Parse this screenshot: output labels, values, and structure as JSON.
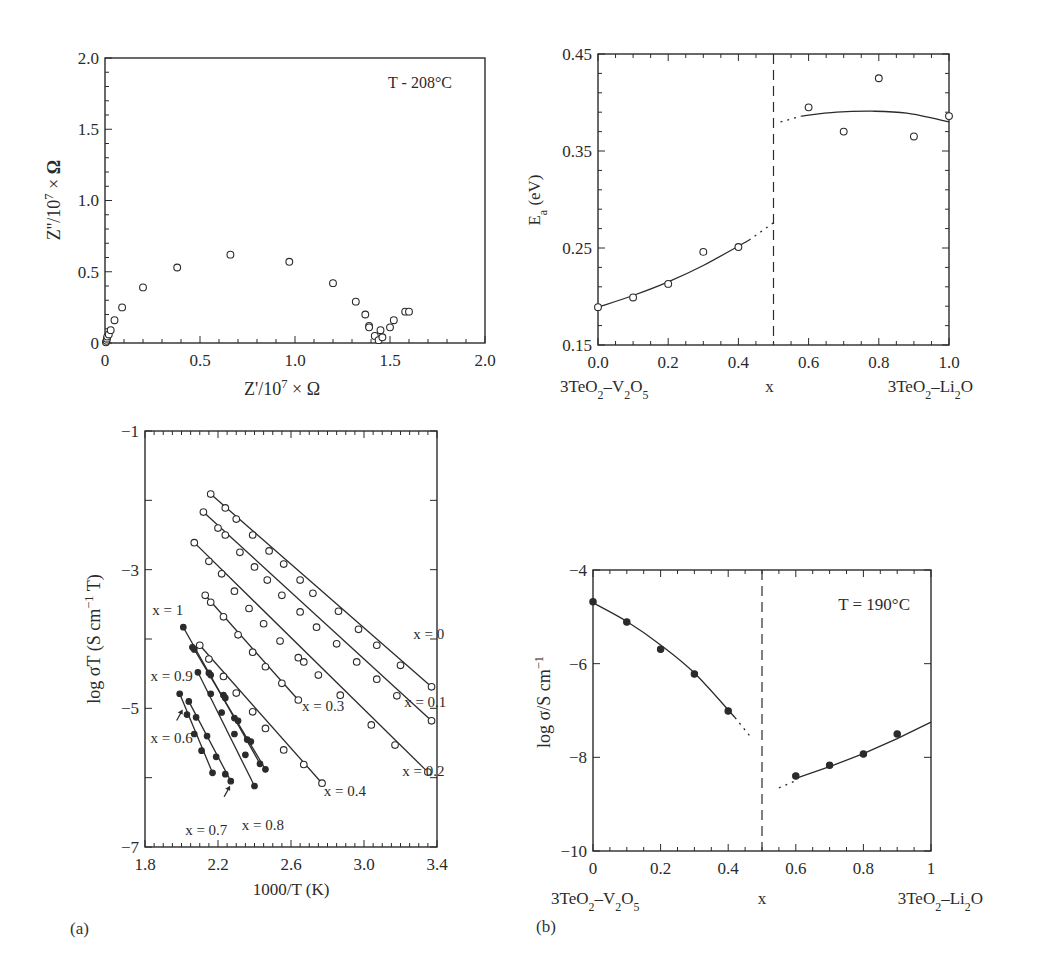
{
  "panel_labels": {
    "a": "(a)",
    "b": "(b)"
  },
  "chart_data": [
    {
      "id": "nyquist",
      "type": "scatter",
      "title": "",
      "annotation": "T - 208°C",
      "xlabel": "Z'/10^7 × Ω",
      "ylabel": "Z''/10^7 × Ω",
      "xlim": [
        0,
        2.0
      ],
      "ylim": [
        0,
        2.0
      ],
      "xticks": [
        "0",
        "0.5",
        "1.0",
        "1.5",
        "2.0"
      ],
      "yticks": [
        "0",
        "0.5",
        "1.0",
        "1.5",
        "2.0"
      ],
      "grid": false,
      "marker": "open-circle",
      "points": [
        [
          0.005,
          0.005
        ],
        [
          0.008,
          0.015
        ],
        [
          0.01,
          0.03
        ],
        [
          0.012,
          0.045
        ],
        [
          0.02,
          0.06
        ],
        [
          0.03,
          0.09
        ],
        [
          0.05,
          0.16
        ],
        [
          0.09,
          0.25
        ],
        [
          0.2,
          0.39
        ],
        [
          0.38,
          0.53
        ],
        [
          0.66,
          0.62
        ],
        [
          0.97,
          0.57
        ],
        [
          1.2,
          0.42
        ],
        [
          1.32,
          0.29
        ],
        [
          1.37,
          0.2
        ],
        [
          1.39,
          0.12
        ],
        [
          1.39,
          0.11
        ],
        [
          1.42,
          0.05
        ],
        [
          1.44,
          0.02
        ],
        [
          1.45,
          0.09
        ],
        [
          1.46,
          0.04
        ],
        [
          1.5,
          0.11
        ],
        [
          1.52,
          0.16
        ],
        [
          1.58,
          0.22
        ],
        [
          1.6,
          0.22
        ]
      ]
    },
    {
      "id": "activation-energy",
      "type": "scatter",
      "title": "",
      "xlabel": "x",
      "ylabel": "Ea (eV)",
      "x_end_labels": {
        "left": "3TeO2–V2O5",
        "right": "3TeO2–Li2O"
      },
      "xlim": [
        0.0,
        1.0
      ],
      "ylim": [
        0.15,
        0.45
      ],
      "xticks": [
        "0.0",
        "0.2",
        "0.4",
        "0.6",
        "0.8",
        "1.0"
      ],
      "yticks": [
        "0.15",
        "0.25",
        "0.35",
        "0.45"
      ],
      "divider_x": 0.5,
      "grid": false,
      "marker": "open-circle",
      "x": [
        0.0,
        0.1,
        0.2,
        0.3,
        0.4,
        0.6,
        0.7,
        0.8,
        0.9,
        1.0
      ],
      "values": [
        0.189,
        0.199,
        0.213,
        0.246,
        0.251,
        0.395,
        0.37,
        0.425,
        0.365,
        0.386
      ],
      "fit_left": [
        [
          0.0,
          0.189
        ],
        [
          0.1,
          0.201
        ],
        [
          0.2,
          0.215
        ],
        [
          0.3,
          0.232
        ],
        [
          0.43,
          0.258
        ]
      ],
      "fit_left_dotted": [
        [
          0.43,
          0.258
        ],
        [
          0.5,
          0.276
        ]
      ],
      "fit_right_dotted": [
        [
          0.52,
          0.38
        ],
        [
          0.58,
          0.386
        ]
      ],
      "fit_right": [
        [
          0.58,
          0.386
        ],
        [
          0.68,
          0.39
        ],
        [
          0.78,
          0.391
        ],
        [
          0.88,
          0.389
        ],
        [
          1.0,
          0.38
        ]
      ]
    },
    {
      "id": "arrhenius",
      "type": "line",
      "title": "",
      "xlabel": "1000/T (K)",
      "ylabel": "log σT (S cm⁻¹ T)",
      "xlim": [
        1.8,
        3.4
      ],
      "ylim": [
        -7,
        -1
      ],
      "xticks": [
        "1.8",
        "2.2",
        "2.6",
        "3.0",
        "3.4"
      ],
      "yticks": [
        "-7",
        "-5",
        "-3",
        "-1"
      ],
      "grid": false,
      "series": [
        {
          "name": "x = 0",
          "marker": "open",
          "label_pos": [
            3.27,
            -4.0
          ],
          "points": [
            [
              2.16,
              -1.91
            ],
            [
              2.24,
              -2.11
            ],
            [
              2.3,
              -2.27
            ],
            [
              2.39,
              -2.5
            ],
            [
              2.48,
              -2.73
            ],
            [
              2.56,
              -2.92
            ],
            [
              2.65,
              -3.15
            ],
            [
              2.72,
              -3.34
            ],
            [
              2.86,
              -3.6
            ],
            [
              2.97,
              -3.86
            ],
            [
              3.07,
              -4.09
            ],
            [
              3.2,
              -4.38
            ],
            [
              3.37,
              -4.69
            ]
          ]
        },
        {
          "name": "x = 0.1",
          "marker": "open",
          "label_pos": [
            3.22,
            -4.98
          ],
          "points": [
            [
              2.12,
              -2.17
            ],
            [
              2.2,
              -2.4
            ],
            [
              2.24,
              -2.5
            ],
            [
              2.32,
              -2.75
            ],
            [
              2.4,
              -2.96
            ],
            [
              2.47,
              -3.15
            ],
            [
              2.55,
              -3.37
            ],
            [
              2.65,
              -3.61
            ],
            [
              2.74,
              -3.83
            ],
            [
              2.85,
              -4.07
            ],
            [
              2.96,
              -4.33
            ],
            [
              3.07,
              -4.58
            ],
            [
              3.18,
              -4.82
            ],
            [
              3.37,
              -5.18
            ]
          ]
        },
        {
          "name": "x = 0.2",
          "marker": "open",
          "label_pos": [
            3.21,
            -5.97
          ],
          "points": [
            [
              2.07,
              -2.61
            ],
            [
              2.15,
              -2.88
            ],
            [
              2.22,
              -3.06
            ],
            [
              2.29,
              -3.31
            ],
            [
              2.37,
              -3.56
            ],
            [
              2.45,
              -3.78
            ],
            [
              2.54,
              -4.03
            ],
            [
              2.64,
              -4.27
            ],
            [
              2.67,
              -4.33
            ],
            [
              2.75,
              -4.52
            ],
            [
              2.87,
              -4.81
            ],
            [
              3.04,
              -5.24
            ],
            [
              3.17,
              -5.53
            ],
            [
              3.35,
              -5.92
            ]
          ]
        },
        {
          "name": "x = 0.3",
          "marker": "open",
          "label_pos": [
            2.66,
            -5.04
          ],
          "points": [
            [
              2.13,
              -3.37
            ],
            [
              2.16,
              -3.47
            ],
            [
              2.23,
              -3.68
            ],
            [
              2.31,
              -3.94
            ],
            [
              2.39,
              -4.19
            ],
            [
              2.46,
              -4.4
            ],
            [
              2.55,
              -4.64
            ],
            [
              2.64,
              -4.88
            ]
          ]
        },
        {
          "name": "x = 0.4",
          "marker": "open",
          "label_pos": [
            2.78,
            -6.26
          ],
          "points": [
            [
              2.1,
              -4.09
            ],
            [
              2.15,
              -4.29
            ],
            [
              2.23,
              -4.54
            ],
            [
              2.3,
              -4.78
            ],
            [
              2.39,
              -5.05
            ],
            [
              2.46,
              -5.29
            ],
            [
              2.56,
              -5.6
            ],
            [
              2.67,
              -5.81
            ],
            [
              2.77,
              -6.08
            ]
          ]
        },
        {
          "name": "x = 1",
          "marker": "filled",
          "label_pos": [
            1.84,
            -3.65
          ],
          "points": [
            [
              2.01,
              -3.83
            ],
            [
              2.06,
              -4.12
            ],
            [
              2.15,
              -4.49
            ],
            [
              2.23,
              -4.81
            ],
            [
              2.29,
              -5.14
            ],
            [
              2.36,
              -5.45
            ],
            [
              2.43,
              -5.8
            ]
          ]
        },
        {
          "name": "x = 0.9",
          "marker": "filled",
          "label_pos": [
            1.83,
            -4.6
          ],
          "points": [
            [
              2.07,
              -4.15
            ],
            [
              2.16,
              -4.52
            ],
            [
              2.24,
              -4.85
            ],
            [
              2.31,
              -5.18
            ],
            [
              2.38,
              -5.48
            ],
            [
              2.46,
              -5.88
            ]
          ]
        },
        {
          "name": "x = 0.8",
          "marker": "filled",
          "label_pos": [
            2.33,
            -6.75
          ],
          "points": [
            [
              2.09,
              -4.48
            ],
            [
              2.16,
              -4.79
            ],
            [
              2.22,
              -5.06
            ],
            [
              2.29,
              -5.37
            ],
            [
              2.35,
              -5.67
            ],
            [
              2.4,
              -6.12
            ]
          ]
        },
        {
          "name": "x = 0.7",
          "marker": "filled",
          "label_pos": [
            2.02,
            -6.82
          ],
          "points": [
            [
              2.04,
              -4.9
            ],
            [
              2.08,
              -5.13
            ],
            [
              2.14,
              -5.4
            ],
            [
              2.19,
              -5.7
            ],
            [
              2.24,
              -5.95
            ],
            [
              2.27,
              -6.05
            ]
          ]
        },
        {
          "name": "x = 0.6",
          "marker": "filled",
          "label_pos": [
            1.83,
            -5.5
          ],
          "points": [
            [
              1.99,
              -4.79
            ],
            [
              2.03,
              -5.09
            ],
            [
              2.07,
              -5.37
            ],
            [
              2.11,
              -5.61
            ],
            [
              2.17,
              -5.93
            ]
          ]
        }
      ],
      "arrows": [
        {
          "label": "x = 0.6",
          "at": [
            1.99,
            -5.06
          ]
        },
        {
          "label": "x = 0.7",
          "at": [
            2.25,
            -6.16
          ]
        }
      ]
    },
    {
      "id": "conductivity-190C",
      "type": "scatter",
      "title": "",
      "annotation": "T = 190°C",
      "xlabel": "x",
      "ylabel": "log σ/S cm⁻¹",
      "x_end_labels": {
        "left": "3TeO2–V2O5",
        "right": "3TeO2–Li2O"
      },
      "xlim": [
        0,
        1
      ],
      "ylim": [
        -10,
        -4
      ],
      "xticks": [
        "0",
        "0.2",
        "0.4",
        "0.6",
        "0.8",
        "1"
      ],
      "yticks": [
        "-10",
        "-8",
        "-6",
        "-4"
      ],
      "divider_x": 0.5,
      "grid": false,
      "marker": "filled-circle",
      "x": [
        0.0,
        0.1,
        0.2,
        0.3,
        0.4,
        0.6,
        0.7,
        0.8,
        0.9
      ],
      "values": [
        -4.68,
        -5.11,
        -5.69,
        -6.22,
        -7.01,
        -8.4,
        -8.17,
        -7.93,
        -7.5
      ],
      "fit_left": [
        [
          0.0,
          -4.7
        ],
        [
          0.1,
          -5.1
        ],
        [
          0.2,
          -5.6
        ],
        [
          0.3,
          -6.2
        ],
        [
          0.42,
          -7.15
        ]
      ],
      "fit_left_dotted": [
        [
          0.42,
          -7.15
        ],
        [
          0.47,
          -7.6
        ]
      ],
      "fit_right_dotted": [
        [
          0.55,
          -8.65
        ],
        [
          0.6,
          -8.5
        ]
      ],
      "fit_right": [
        [
          0.6,
          -8.45
        ],
        [
          0.7,
          -8.2
        ],
        [
          0.8,
          -7.92
        ],
        [
          0.9,
          -7.6
        ],
        [
          1.0,
          -7.25
        ]
      ]
    }
  ]
}
